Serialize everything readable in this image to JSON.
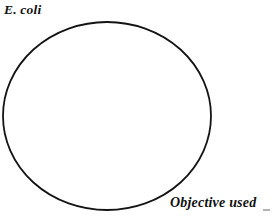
{
  "figure": {
    "background_color": "#ffffff",
    "stroke_color": "#141414",
    "text_color": "#111111",
    "width": 272,
    "height": 217
  },
  "labels": {
    "specimen": "E. coli",
    "objective": "Objective used"
  },
  "field_of_view": {
    "shape": "circle",
    "center_x": 107,
    "center_y": 116,
    "radius_x": 104,
    "radius_y": 94,
    "stroke_width": 1.8,
    "fill": "none"
  }
}
